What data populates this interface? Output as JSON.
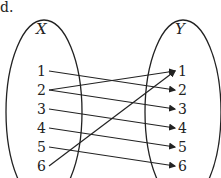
{
  "label": "d.",
  "sets": {
    "domain": {
      "name": "X",
      "elements": [
        "1",
        "2",
        "3",
        "4",
        "5",
        "6"
      ]
    },
    "codomain": {
      "name": "Y",
      "elements": [
        "1",
        "2",
        "3",
        "4",
        "5",
        "6"
      ]
    }
  },
  "mappings": [
    {
      "from": "1",
      "to": "2"
    },
    {
      "from": "2",
      "to": "1"
    },
    {
      "from": "2",
      "to": "3"
    },
    {
      "from": "3",
      "to": "4"
    },
    {
      "from": "4",
      "to": "5"
    },
    {
      "from": "5",
      "to": "6"
    },
    {
      "from": "6",
      "to": "1"
    }
  ],
  "colors": {
    "ink": "#222222"
  }
}
